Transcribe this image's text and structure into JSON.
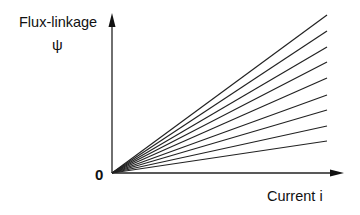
{
  "diagram": {
    "y_axis_label": "Flux-linkage",
    "y_axis_symbol": "ψ",
    "x_axis_label": "Current i",
    "origin_label": "0",
    "line_color": "#222222",
    "origin": [
      112,
      173
    ],
    "line_end_x": 327,
    "line_end_y": [
      15,
      31,
      47,
      62,
      78,
      95,
      110,
      126,
      141
    ]
  }
}
